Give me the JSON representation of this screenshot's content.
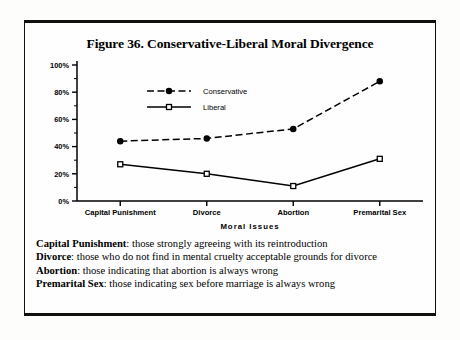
{
  "figure": {
    "title": "Figure 36. Conservative-Liberal Moral Divergence"
  },
  "chart_data": {
    "type": "line",
    "title": "Figure 36. Conservative-Liberal Moral Divergence",
    "xlabel": "Moral  Issues",
    "ylabel": "",
    "categories": [
      "Capital  Punishment",
      "Divorce",
      "Abortion",
      "Premarital  Sex"
    ],
    "series": [
      {
        "name": "Conservative",
        "values": [
          44,
          46,
          53,
          88
        ],
        "style": "dashed",
        "marker": "filled-circle"
      },
      {
        "name": "Liberal",
        "values": [
          27,
          20,
          11,
          31
        ],
        "style": "solid",
        "marker": "open-square"
      }
    ],
    "ylim": [
      0,
      100
    ],
    "ytick_labels": [
      "0%",
      "20%",
      "40%",
      "60%",
      "80%",
      "100%"
    ],
    "ytick_values": [
      0,
      20,
      40,
      60,
      80,
      100
    ],
    "yminor_step": 10,
    "grid": false,
    "legend_position": "inside-top-left"
  },
  "notes": [
    {
      "term": "Capital Punishment",
      "text": ": those strongly agreeing with its reintroduction"
    },
    {
      "term": "Divorce",
      "text": ": those who do not find in mental cruelty acceptable grounds for divorce"
    },
    {
      "term": "Abortion",
      "text": ": those indicating that abortion is always wrong"
    },
    {
      "term": "Premarital Sex",
      "text": ": those indicating sex before marriage is always wrong"
    }
  ],
  "colors": {
    "ink": "#000000",
    "page": "#fdfdfb"
  }
}
